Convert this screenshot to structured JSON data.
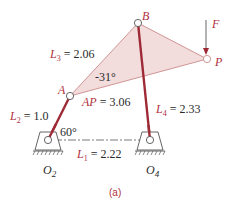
{
  "colors": {
    "link": "#9e2a36",
    "coupler_fill": "#f3dcdc",
    "coupler_edge": "#c98a8a",
    "ground": "#555555",
    "text": "#2a2a2a",
    "accent_text": "#b03040"
  },
  "points": {
    "A": "A",
    "B": "B",
    "P": "P",
    "F": "F"
  },
  "ground_labels": {
    "O2": "O",
    "O2_sub": "2",
    "O4": "O",
    "O4_sub": "4"
  },
  "dimensions": {
    "L1": {
      "sym": "L",
      "sub": "1",
      "val": " = 2.22"
    },
    "L2": {
      "sym": "L",
      "sub": "2",
      "val": " = 1.0"
    },
    "L3": {
      "sym": "L",
      "sub": "3",
      "val": " = 2.06"
    },
    "L4": {
      "sym": "L",
      "sub": "4",
      "val": " = 2.33"
    },
    "AP": {
      "sym": "AP",
      "val": " = 3.06"
    }
  },
  "angles": {
    "theta2": "60°",
    "coupler": "-31°"
  },
  "caption": "(a)"
}
